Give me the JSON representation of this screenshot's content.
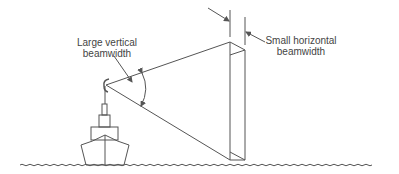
{
  "diagram": {
    "labels": {
      "vertical": {
        "line1": "Large vertical",
        "line2": "beamwidth"
      },
      "horizontal": {
        "line1": "Small horizontal",
        "line2": "beamwidth"
      }
    },
    "elements": [
      "ship",
      "radar-antenna",
      "radar-beam",
      "sea-surface"
    ],
    "colors": {
      "stroke": "#555555",
      "text": "#444444",
      "background": "#ffffff"
    }
  }
}
